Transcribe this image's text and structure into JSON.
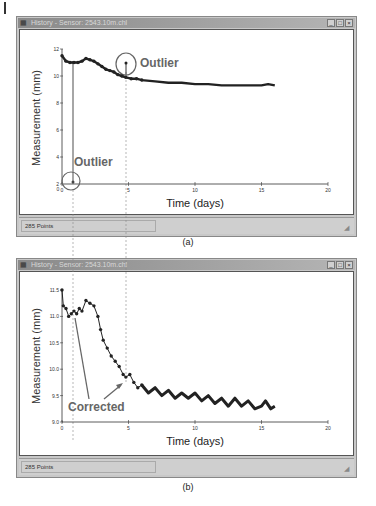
{
  "figure": {
    "panels": [
      {
        "id": "a",
        "caption": "(a)",
        "window": {
          "title": "History - Sensor: 2543.10m.chl",
          "buttons": [
            "minimize",
            "maximize",
            "close"
          ],
          "status": "285 Points"
        }
      },
      {
        "id": "b",
        "caption": "(b)",
        "window": {
          "title": "History - Sensor: 2543.10m.chl",
          "buttons": [
            "minimize",
            "maximize",
            "close"
          ],
          "status": "285 Points"
        }
      }
    ]
  },
  "labels": {
    "a_ylabel": "Measurement (mm)",
    "a_xlabel": "Time (days)",
    "a_outlier_top": "Outlier",
    "a_outlier_bottom": "Outlier",
    "b_ylabel": "Measurement (mm)",
    "b_xlabel": "Time (days)",
    "b_annotation": "Corrected",
    "a_yticks": [
      "12",
      "10",
      "8",
      "6",
      "4",
      "2",
      "0"
    ],
    "a_xticks": [
      "5",
      "10",
      "15",
      "20"
    ],
    "b_yticks": [
      "11.5",
      "11.0",
      "10.5",
      "10.0",
      "9.5",
      "9.0"
    ],
    "b_xticks": [
      "0",
      "5",
      "10",
      "15",
      "20"
    ]
  },
  "icons": {
    "window_icon": "▦",
    "minimize": "_",
    "maximize": "□",
    "close": "×",
    "grip": "◢"
  },
  "chart_data": [
    {
      "type": "line",
      "title": "History - Sensor: 2543.10m.chl (a)",
      "xlabel": "Time (days)",
      "ylabel": "Measurement (mm)",
      "xlim": [
        0,
        20
      ],
      "ylim": [
        2,
        12
      ],
      "xticks": [
        0,
        5,
        10,
        15,
        20
      ],
      "yticks": [
        2,
        4,
        6,
        8,
        10,
        12
      ],
      "grid": false,
      "points_count": 285,
      "series": [
        {
          "name": "Measurement",
          "x": [
            0,
            0.3,
            0.6,
            0.9,
            1.2,
            1.5,
            1.8,
            2.1,
            2.4,
            2.7,
            3.0,
            3.3,
            3.6,
            3.9,
            4.2,
            4.5,
            4.8,
            5.2,
            5.6,
            6.0,
            7,
            8,
            9,
            10,
            11,
            12,
            13,
            14,
            15,
            15.5,
            16
          ],
          "y": [
            11.5,
            11.1,
            11.0,
            11.0,
            11.0,
            11.1,
            11.3,
            11.2,
            11.1,
            10.9,
            10.7,
            10.5,
            10.4,
            10.3,
            10.1,
            10.0,
            9.9,
            9.8,
            9.8,
            9.7,
            9.6,
            9.5,
            9.5,
            9.4,
            9.4,
            9.3,
            9.3,
            9.3,
            9.3,
            9.4,
            9.3
          ]
        }
      ],
      "annotations": [
        {
          "text": "Outlier",
          "x": 4.8,
          "y": 11.0,
          "note": "circled high spike near day 5"
        },
        {
          "text": "Outlier",
          "x": 0.8,
          "y": 2.2,
          "note": "circled low spike near day 1"
        }
      ]
    },
    {
      "type": "line",
      "title": "History - Sensor: 2543.10m.chl (b)",
      "xlabel": "Time (days)",
      "ylabel": "Measurement (mm)",
      "xlim": [
        0,
        20
      ],
      "ylim": [
        9.0,
        11.5
      ],
      "xticks": [
        0,
        5,
        10,
        15,
        20
      ],
      "yticks": [
        9.0,
        9.5,
        10.0,
        10.5,
        11.0,
        11.5
      ],
      "grid": false,
      "points_count": 285,
      "series": [
        {
          "name": "Measurement (corrected)",
          "x": [
            0,
            0.1,
            0.3,
            0.5,
            0.7,
            0.9,
            1.1,
            1.3,
            1.5,
            1.8,
            2.1,
            2.4,
            2.7,
            2.9,
            3.1,
            3.4,
            3.7,
            4.0,
            4.3,
            4.6,
            4.8,
            5.1,
            5.4,
            5.7,
            6.0,
            6.5,
            7,
            7.5,
            8,
            8.5,
            9,
            9.5,
            10,
            10.5,
            11,
            11.5,
            12,
            12.5,
            13,
            13.5,
            14,
            14.5,
            15,
            15.3,
            15.7,
            16
          ],
          "y": [
            11.5,
            11.2,
            11.15,
            11.0,
            11.05,
            11.1,
            11.05,
            11.15,
            11.1,
            11.3,
            11.25,
            11.2,
            11.0,
            10.75,
            10.55,
            10.4,
            10.25,
            10.15,
            10.05,
            9.9,
            9.85,
            9.9,
            9.75,
            9.65,
            9.7,
            9.55,
            9.65,
            9.5,
            9.6,
            9.45,
            9.55,
            9.45,
            9.55,
            9.4,
            9.5,
            9.35,
            9.45,
            9.3,
            9.45,
            9.3,
            9.4,
            9.25,
            9.3,
            9.4,
            9.25,
            9.3
          ]
        }
      ],
      "annotations": [
        {
          "text": "Corrected",
          "x": 0.8,
          "y": 11.0,
          "note": "arrow to corrected point near day 1"
        },
        {
          "text": "Corrected",
          "x": 4.8,
          "y": 9.9,
          "note": "arrow to corrected point near day 5"
        }
      ]
    }
  ]
}
